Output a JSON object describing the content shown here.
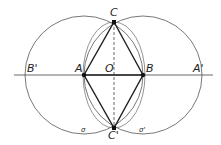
{
  "diagram": {
    "points": {
      "A": {
        "label": "A",
        "x": 84,
        "y": 75
      },
      "B": {
        "label": "B",
        "x": 143,
        "y": 75
      },
      "O": {
        "label": "O",
        "x": 114,
        "y": 75
      },
      "C": {
        "label": "C",
        "x": 114,
        "y": 22
      },
      "Cp": {
        "label": "C'",
        "x": 114,
        "y": 128
      },
      "Bp": {
        "label": "B'",
        "x": 30,
        "y": 75
      },
      "Ap": {
        "label": "A'",
        "x": 196,
        "y": 75
      }
    },
    "circles": {
      "sigma": {
        "label": "σ",
        "center": "A",
        "r": 59
      },
      "sigma_prime": {
        "label": "σ'",
        "center": "B",
        "r": 59
      }
    },
    "line_color": "#333333"
  }
}
